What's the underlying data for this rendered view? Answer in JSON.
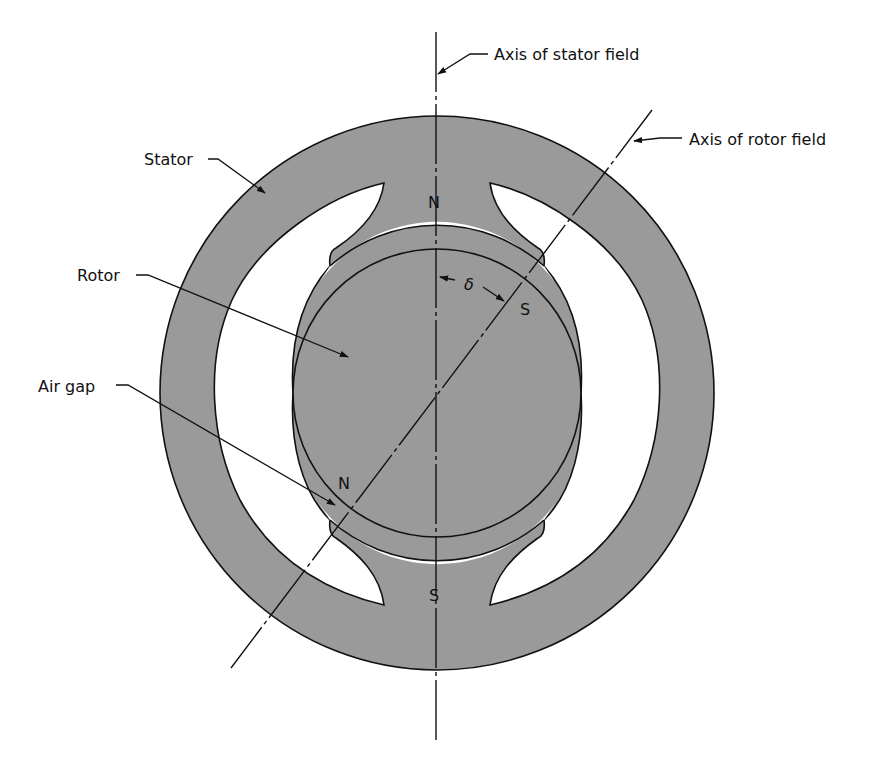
{
  "diagram": {
    "colors": {
      "iron": "#9a9a9a",
      "outline": "#111111",
      "background": "#ffffff"
    },
    "labels": {
      "stator": "Stator",
      "rotor": "Rotor",
      "air_gap": "Air gap",
      "stator_axis": "Axis of stator field",
      "rotor_axis": "Axis of rotor field",
      "angle": "δ"
    },
    "poles": {
      "stator_north": "N",
      "stator_south": "S",
      "rotor_north": "N",
      "rotor_south": "S"
    }
  }
}
